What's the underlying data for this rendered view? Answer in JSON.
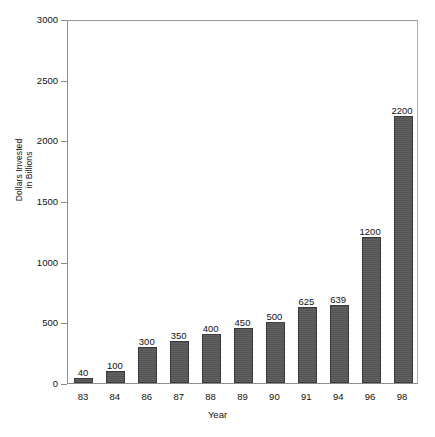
{
  "chart_data": {
    "type": "bar",
    "title": "",
    "xlabel": "Year",
    "ylabel": "Dollars Invested in Billions",
    "ylabel_line1": "Dollars Invested",
    "ylabel_line2": "in Billions",
    "categories": [
      "83",
      "84",
      "86",
      "87",
      "88",
      "89",
      "90",
      "91",
      "94",
      "96",
      "98"
    ],
    "values": [
      40,
      100,
      300,
      350,
      400,
      450,
      500,
      625,
      639,
      1200,
      2200
    ],
    "data_labels": [
      "40",
      "100",
      "300",
      "350",
      "400",
      "450",
      "500",
      "625",
      "639",
      "1200",
      "2200"
    ],
    "ylim": [
      0,
      3000
    ],
    "yticks": [
      0,
      500,
      1000,
      1500,
      2000,
      2500,
      3000
    ],
    "ytick_labels": [
      "0",
      "500",
      "1000",
      "1500",
      "2000",
      "2500",
      "3000"
    ],
    "grid": false,
    "legend": false,
    "legend_position": "none",
    "bar_color": "#575757",
    "bar_edge_color": "#3a3a3a",
    "axis_color": "#8d8d8d",
    "background_color": "#ffffff",
    "text_color": "#111111"
  }
}
